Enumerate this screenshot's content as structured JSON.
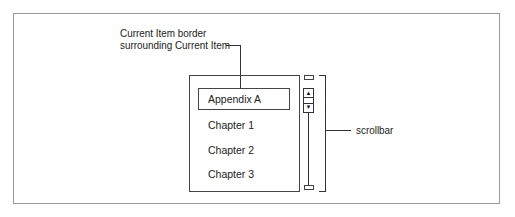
{
  "diagram": {
    "callout": {
      "line1": "Current Item border",
      "line2": "surrounding Current Item"
    },
    "list_items": [
      {
        "label": "Appendix A",
        "current": true
      },
      {
        "label": "Chapter 1",
        "current": false
      },
      {
        "label": "Chapter 2",
        "current": false
      },
      {
        "label": "Chapter 3",
        "current": false
      }
    ],
    "scrollbar": {
      "label": "scrollbar",
      "up_arrow": "▲",
      "down_arrow": "▼"
    }
  }
}
